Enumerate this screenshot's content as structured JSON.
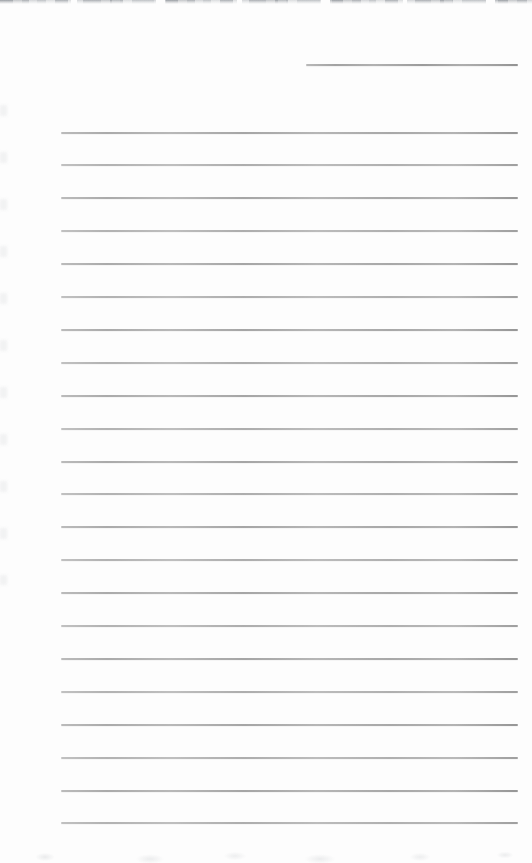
{
  "document": {
    "kind": "scanned blank ruled notebook page",
    "text_content": "",
    "header_line": {
      "present": true,
      "value": ""
    },
    "ruled_lines": {
      "count": 22,
      "value_per_line": ""
    },
    "colors": {
      "paper": "#fdfdfd",
      "rule": "#a6a6a6",
      "header_rule": "#9b9b9b",
      "torn_edge": "#8c9298"
    }
  }
}
